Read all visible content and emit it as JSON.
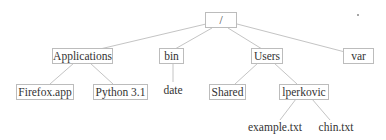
{
  "diagram": {
    "type": "directory-tree",
    "colors": {
      "line": "#c4c4c4",
      "box_border": "#bcbcbc",
      "text": "#333333"
    },
    "nodes": {
      "root": {
        "label": "/"
      },
      "applications": {
        "label": "Applications"
      },
      "bin": {
        "label": "bin"
      },
      "users": {
        "label": "Users"
      },
      "var": {
        "label": "var"
      },
      "firefox": {
        "label": "Firefox.app"
      },
      "python": {
        "label": "Python 3.1"
      },
      "date": {
        "label": "date"
      },
      "shared": {
        "label": "Shared"
      },
      "lperkovic": {
        "label": "lperkovic"
      },
      "example": {
        "label": "example.txt"
      },
      "chin": {
        "label": "chin.txt"
      }
    },
    "edges": [
      [
        "root",
        "applications"
      ],
      [
        "root",
        "bin"
      ],
      [
        "root",
        "users"
      ],
      [
        "root",
        "var"
      ],
      [
        "applications",
        "firefox"
      ],
      [
        "applications",
        "python"
      ],
      [
        "bin",
        "date"
      ],
      [
        "users",
        "shared"
      ],
      [
        "users",
        "lperkovic"
      ],
      [
        "lperkovic",
        "example"
      ],
      [
        "lperkovic",
        "chin"
      ]
    ]
  }
}
